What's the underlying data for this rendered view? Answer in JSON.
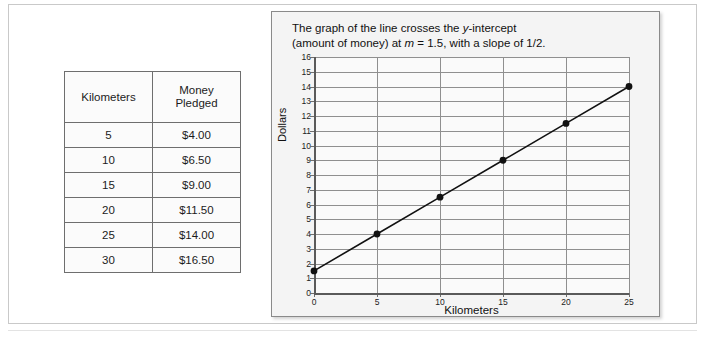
{
  "table": {
    "headers": [
      "Kilometers",
      "Money\nPledged"
    ],
    "header_km": "Kilometers",
    "header_money_line1": "Money",
    "header_money_line2": "Pledged",
    "rows": [
      {
        "kilometers": "5",
        "money": "$4.00"
      },
      {
        "kilometers": "10",
        "money": "$6.50"
      },
      {
        "kilometers": "15",
        "money": "$9.00"
      },
      {
        "kilometers": "20",
        "money": "$11.50"
      },
      {
        "kilometers": "25",
        "money": "$14.00"
      },
      {
        "kilometers": "30",
        "money": "$16.50"
      }
    ]
  },
  "caption": {
    "line1_a": "The graph of the line crosses the ",
    "line1_italic": "y",
    "line1_b": "-intercept",
    "line2_a": "(amount of money) at ",
    "line2_italic": "m",
    "line2_b": " = 1.5, with a slope of 1/2."
  },
  "chart_data": {
    "type": "line",
    "title": "",
    "xlabel": "Kilometers",
    "ylabel": "Dollars",
    "xlim": [
      0,
      25
    ],
    "ylim": [
      0,
      16
    ],
    "xticks": [
      0,
      5,
      10,
      15,
      20,
      25
    ],
    "yticks": [
      0,
      1,
      2,
      3,
      4,
      5,
      6,
      7,
      8,
      9,
      10,
      11,
      12,
      13,
      14,
      15,
      16
    ],
    "grid": true,
    "legend": "none",
    "markers": "filled-circle",
    "line_color": "#111111",
    "marker_color": "#111111",
    "x": [
      0,
      5,
      10,
      15,
      20,
      25
    ],
    "y": [
      1.5,
      4,
      6.5,
      9,
      11.5,
      14
    ],
    "points": [
      {
        "x": 0,
        "y": 1.5
      },
      {
        "x": 5,
        "y": 4
      },
      {
        "x": 10,
        "y": 6.5
      },
      {
        "x": 15,
        "y": 9
      },
      {
        "x": 20,
        "y": 11.5
      },
      {
        "x": 25,
        "y": 14
      }
    ],
    "annotations": [
      "y-intercept at m = 1.5",
      "slope = 1/2"
    ]
  },
  "colors": {
    "panel_bg": "#f4f4f4",
    "plot_bg": "#fafafa",
    "grid": "#8f8f8f",
    "axis": "#5a5a5a",
    "text": "#111111",
    "table_border": "#6e6e6e"
  }
}
